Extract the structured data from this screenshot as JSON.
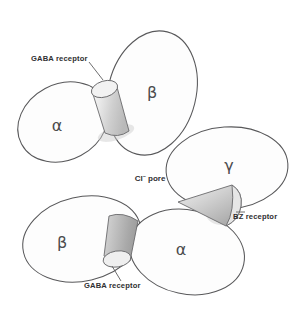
{
  "figure": {
    "background_color": "#ffffff",
    "outline_color": "#58585a",
    "label_color": "#2f2f31"
  },
  "subunits": [
    {
      "id": "alpha-upper-left",
      "label": "α",
      "name": "alpha"
    },
    {
      "id": "beta-upper-right",
      "label": "β",
      "name": "beta"
    },
    {
      "id": "gamma-right",
      "label": "γ",
      "name": "gamma"
    },
    {
      "id": "alpha-lower-right",
      "label": "α",
      "name": "alpha"
    },
    {
      "id": "beta-lower-left",
      "label": "β",
      "name": "beta"
    }
  ],
  "callouts": {
    "gaba_receptor_top": "GABA receptor",
    "gaba_receptor_bottom": "GABA receptor",
    "bz_receptor": "BZ receptor",
    "chloride_pore_prefix": "Cl",
    "chloride_pore_superscript": "–",
    "chloride_pore_suffix": " pore"
  },
  "binding_sites": [
    {
      "id": "gaba-site-top",
      "shape": "cylinder",
      "label": "GABA receptor"
    },
    {
      "id": "gaba-site-bottom",
      "shape": "cylinder",
      "label": "GABA receptor"
    },
    {
      "id": "bz-site",
      "shape": "cone",
      "label": "BZ receptor"
    }
  ],
  "pore": {
    "label_prefix": "Cl",
    "label_superscript": "–",
    "label_suffix": " pore"
  }
}
